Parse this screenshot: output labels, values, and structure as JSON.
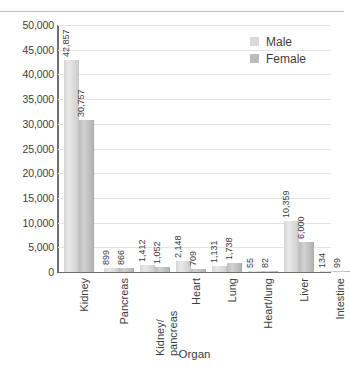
{
  "chart_data": {
    "type": "bar",
    "title": "",
    "xlabel": "Organ",
    "ylabel": "",
    "ylim": [
      0,
      50000
    ],
    "ytick_step": 5000,
    "yticks": [
      "0",
      "5,000",
      "10,000",
      "15,000",
      "20,000",
      "25,000",
      "30,000",
      "35,000",
      "40,000",
      "45,000",
      "50,000"
    ],
    "grid": true,
    "legend_position": "top-right",
    "categories": [
      "Kidney",
      "Pancreas",
      "Kidney/\npancreas",
      "Heart",
      "Lung",
      "Heart/lung",
      "Liver",
      "Intestine"
    ],
    "series": [
      {
        "name": "Male",
        "color": "#d9d9d9",
        "values": [
          42857,
          899,
          1412,
          2148,
          1131,
          55,
          10359,
          134
        ],
        "labels": [
          "42,857",
          "899",
          "1,412",
          "2,148",
          "1,131",
          "55",
          "10,359",
          "134"
        ]
      },
      {
        "name": "Female",
        "color": "#bcbcbc",
        "values": [
          30757,
          866,
          1052,
          709,
          1738,
          82,
          6000,
          99
        ],
        "labels": [
          "30,757",
          "866",
          "1,052",
          "709",
          "1,738",
          "82",
          "6,000",
          "99"
        ]
      }
    ]
  },
  "legend": {
    "items": [
      {
        "label": "Male"
      },
      {
        "label": "Female"
      }
    ]
  },
  "axis": {
    "x_title": "Organ"
  }
}
